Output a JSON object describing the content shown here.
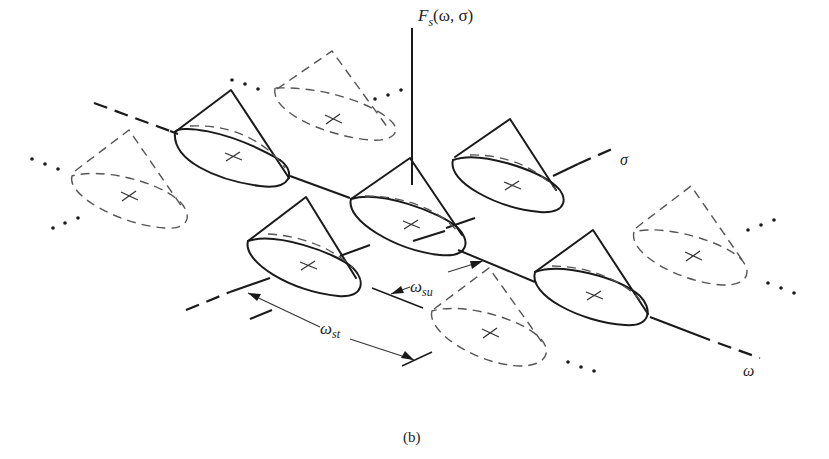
{
  "figure": {
    "caption": "(b)",
    "vertical_axis_label": {
      "main": "F",
      "sub": "s",
      "args": "(ω, σ)"
    },
    "axis_sigma_label": "σ",
    "axis_omega_label": "ω",
    "dimension_st": {
      "main": "ω",
      "sub": "st"
    },
    "dimension_su": {
      "main": "ω",
      "sub": "su"
    },
    "colors": {
      "ink": "#1a1a1a",
      "dashed": "#555555",
      "background": "#ffffff"
    },
    "cones": [
      {
        "id": "left-top",
        "style": "solid"
      },
      {
        "id": "top-dashed",
        "style": "dashed"
      },
      {
        "id": "left-dashed",
        "style": "dashed"
      },
      {
        "id": "center",
        "style": "solid"
      },
      {
        "id": "right-upper",
        "style": "solid"
      },
      {
        "id": "left-lower",
        "style": "solid"
      },
      {
        "id": "right-lower",
        "style": "solid"
      },
      {
        "id": "bottom-dashed",
        "style": "dashed"
      },
      {
        "id": "far-right-dashed",
        "style": "dashed"
      }
    ]
  }
}
